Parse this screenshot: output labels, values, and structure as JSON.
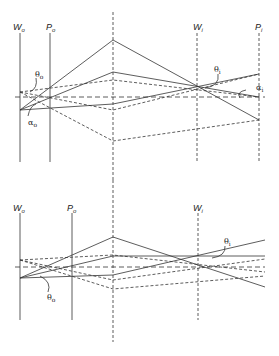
{
  "figure": {
    "top_panel": {
      "labels": {
        "Wo": {
          "main": "W",
          "sub": "o"
        },
        "Po": {
          "main": "P",
          "sub": "o"
        },
        "Wi": {
          "main": "W",
          "sub": "i"
        },
        "Pi": {
          "main": "P",
          "sub": "i"
        },
        "theta_o": {
          "main": "θ",
          "sub": "o"
        },
        "alpha_o": {
          "main": "α",
          "sub": "o"
        },
        "theta_i": {
          "main": "θ",
          "sub": "i"
        },
        "alpha_i": {
          "main": "α",
          "sub": "i"
        }
      }
    },
    "bottom_panel": {
      "labels": {
        "Wo": {
          "main": "W",
          "sub": "o"
        },
        "Po": {
          "main": "P",
          "sub": "o"
        },
        "Wi": {
          "main": "W",
          "sub": "i"
        },
        "theta_o": {
          "main": "θ",
          "sub": "o"
        },
        "theta_i": {
          "main": "θ",
          "sub": "i"
        }
      }
    },
    "colors": {
      "line": "#333333",
      "dashed": "#555555",
      "background": "#ffffff"
    }
  }
}
